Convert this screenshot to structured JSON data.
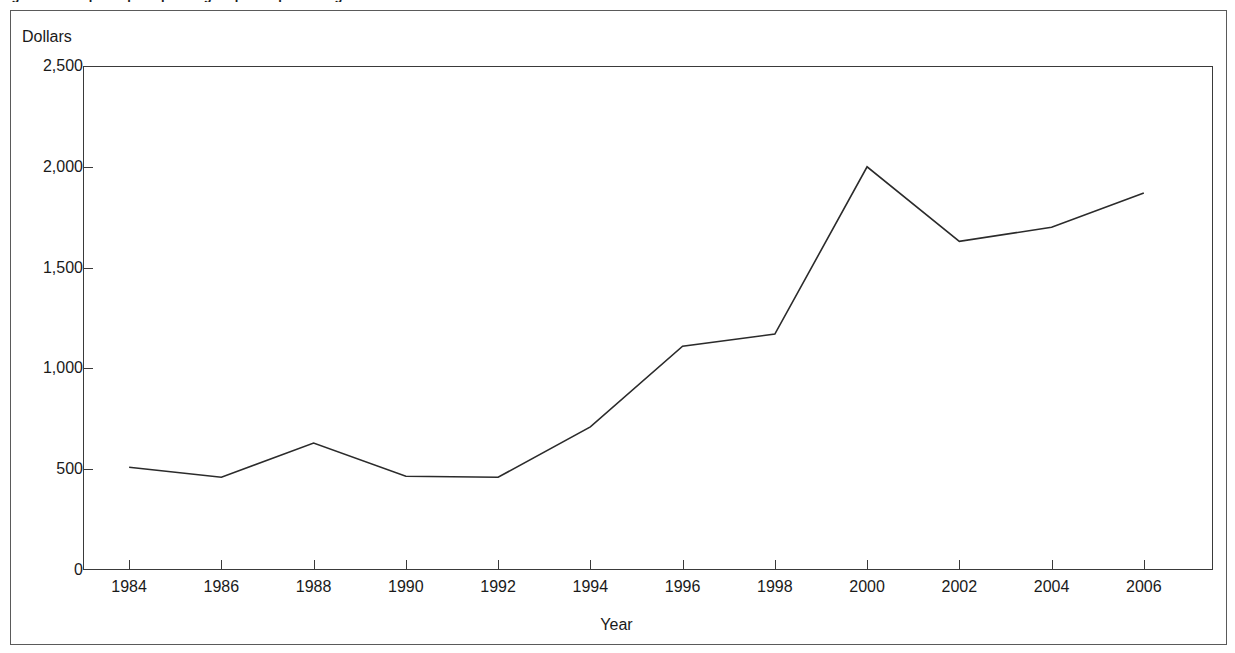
{
  "figure": {
    "caption_partial": "Figure 5. Real per capita spending on prescription drugs",
    "y_axis_unit": "Dollars",
    "x_axis_title": "Year"
  },
  "chart_data": {
    "type": "line",
    "title": "",
    "xlabel": "Year",
    "ylabel": "Dollars",
    "x": [
      1984,
      1986,
      1988,
      1990,
      1992,
      1994,
      1996,
      1998,
      2000,
      2002,
      2004,
      2006
    ],
    "values": [
      510,
      460,
      630,
      465,
      460,
      710,
      1110,
      1170,
      2000,
      1630,
      1700,
      1870
    ],
    "series": [
      {
        "name": "Dollars",
        "values": [
          510,
          460,
          630,
          465,
          460,
          710,
          1110,
          1170,
          2000,
          1630,
          1700,
          1870
        ]
      }
    ],
    "xlim": [
      1983,
      1007.5
    ],
    "x_range": [
      1983,
      2007.5
    ],
    "ylim": [
      0,
      2500
    ],
    "y_ticks": [
      0,
      500,
      1000,
      1500,
      2000,
      2500
    ],
    "y_tick_labels": [
      "0",
      "500",
      "1,000",
      "1,500",
      "2,000",
      "2,500"
    ],
    "x_ticks": [
      1984,
      1986,
      1988,
      1990,
      1992,
      1994,
      1996,
      1998,
      2000,
      2002,
      2004,
      2006
    ],
    "x_tick_labels": [
      "1984",
      "1986",
      "1988",
      "1990",
      "1992",
      "1994",
      "1996",
      "1998",
      "2000",
      "2002",
      "2004",
      "2006"
    ],
    "grid": false,
    "legend": false,
    "legend_position": "none",
    "line_color": "#2b2b2b",
    "background_color": "#ffffff",
    "frame_color": "#3a3a3a"
  }
}
